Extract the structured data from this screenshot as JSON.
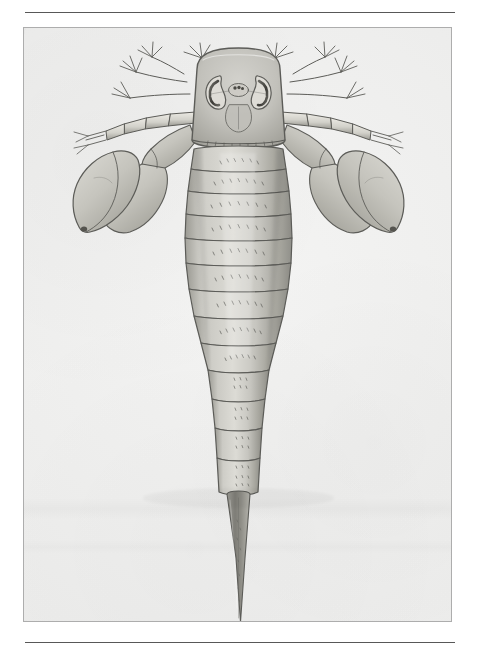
{
  "document": {
    "type": "scanned-plate",
    "page_background": "#ffffff",
    "plate_background": "#eeeeed",
    "frame_border_color": "#adadad",
    "rule_color": "#4a4a4a",
    "ink_color": "#5c5c58",
    "caption": "",
    "header_text": "",
    "footer_text": "",
    "page_number": ""
  },
  "rules": {
    "top": {
      "present": true,
      "y": 12
    },
    "bottom": {
      "present": true,
      "y": 642
    }
  },
  "frame": {
    "x": 23,
    "y": 27,
    "width": 429,
    "height": 595
  },
  "illustration": {
    "subject": "eurypterid-dorsal-view",
    "technique": "lithograph-halftone",
    "orientation": "dorsal",
    "parts": [
      {
        "name": "carapace",
        "label": ""
      },
      {
        "name": "compound-eye-left",
        "label": ""
      },
      {
        "name": "compound-eye-right",
        "label": ""
      },
      {
        "name": "median-ocelli",
        "label": ""
      },
      {
        "name": "prosomal-appendage-left",
        "label": ""
      },
      {
        "name": "prosomal-appendage-right",
        "label": ""
      },
      {
        "name": "swimming-paddle-left",
        "label": ""
      },
      {
        "name": "swimming-paddle-right",
        "label": ""
      },
      {
        "name": "mesosoma-tergites",
        "label": ""
      },
      {
        "name": "metasoma-segments",
        "label": ""
      },
      {
        "name": "telson-spike",
        "label": ""
      }
    ],
    "tergite_count": 12,
    "figure_numbers": [],
    "annotations": []
  }
}
